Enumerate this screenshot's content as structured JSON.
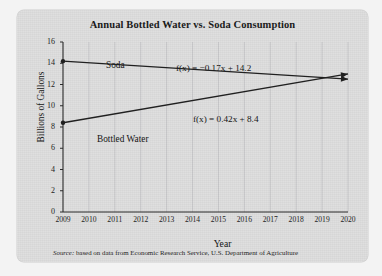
{
  "figure": {
    "title": "Annual Bottled Water vs. Soda Consumption",
    "source_word": "Source:",
    "source_text": " based on data from Economic Research Service, U.S. Department of Agriculture",
    "panel_color": "#dcdcdc",
    "line_color": "#202020"
  },
  "chart_data": {
    "type": "line",
    "title": "Annual Bottled Water vs. Soda Consumption",
    "xlabel": "Year",
    "ylabel": "Billions of Gallons",
    "xlim": [
      2009,
      2020
    ],
    "ylim": [
      0,
      16
    ],
    "ytick_step": 2,
    "grid": "vertical-faint",
    "legend": "inline-labels",
    "x_ticks": [
      "2009",
      "2010",
      "2011",
      "2012",
      "2013",
      "2014",
      "2015",
      "2016",
      "2017",
      "2018",
      "2019",
      "2020"
    ],
    "y_ticks": [
      "0",
      "2",
      "4",
      "6",
      "8",
      "10",
      "12",
      "14",
      "16"
    ],
    "x": [
      2009,
      2020
    ],
    "series": [
      {
        "name": "Soda",
        "label": "Soda",
        "equation": "f(x) = −0.17x + 14.2",
        "slope": -0.17,
        "intercept": 14.2,
        "values": [
          14.2,
          12.5
        ]
      },
      {
        "name": "Bottled Water",
        "label": "Bottled Water",
        "equation": "f(x) = 0.42x + 8.4",
        "slope": 0.42,
        "intercept": 8.4,
        "values": [
          8.4,
          13.0
        ]
      }
    ],
    "annotations": [
      {
        "text": "Soda",
        "kind": "series-label"
      },
      {
        "text": "Bottled Water",
        "kind": "series-label"
      },
      {
        "text": "f(x) = −0.17x + 14.2",
        "kind": "equation"
      },
      {
        "text": "f(x) = 0.42x + 8.4",
        "kind": "equation"
      }
    ]
  }
}
